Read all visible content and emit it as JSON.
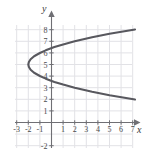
{
  "figure": {
    "background_color": "#ffffff",
    "grid_color": "#e2e2e6",
    "axis_color": "#6f6f74",
    "curve_color": "#58585e",
    "label_color": "#4a4a4a"
  },
  "axes": {
    "x_label": "x",
    "y_label": "y",
    "x_ticks": [
      "-3",
      "-2",
      "-1",
      "1",
      "2",
      "3",
      "4",
      "5",
      "6",
      "7"
    ],
    "y_ticks": [
      "8",
      "7",
      "6",
      "5",
      "4",
      "3",
      "2",
      "1",
      "-2"
    ]
  },
  "chart_data": {
    "type": "line",
    "title": "",
    "xlabel": "x",
    "ylabel": "y",
    "xlim": [
      -4,
      8
    ],
    "ylim": [
      -3,
      9
    ],
    "grid": true,
    "legend": null,
    "curve_description": "Rightward-opening parabola, vertex at (-2, 5)",
    "equation": "x = (y - 5)^2 - 2",
    "vertex": [
      -2,
      5
    ],
    "series": [
      {
        "name": "parabola",
        "points": [
          [
            7.2,
            8.02
          ],
          [
            5.0,
            7.65
          ],
          [
            3.5,
            7.35
          ],
          [
            2.0,
            7.0
          ],
          [
            1.0,
            6.73
          ],
          [
            0.25,
            6.5
          ],
          [
            -0.5,
            6.22
          ],
          [
            -1.0,
            5.99
          ],
          [
            -1.5,
            5.71
          ],
          [
            -1.8,
            5.45
          ],
          [
            -1.95,
            5.22
          ],
          [
            -2.0,
            5.0
          ],
          [
            -1.95,
            4.78
          ],
          [
            -1.8,
            4.55
          ],
          [
            -1.5,
            4.29
          ],
          [
            -1.0,
            4.01
          ],
          [
            -0.5,
            3.78
          ],
          [
            0.25,
            3.5
          ],
          [
            1.0,
            3.27
          ],
          [
            2.0,
            3.0
          ],
          [
            3.5,
            2.65
          ],
          [
            5.0,
            2.35
          ],
          [
            7.2,
            1.98
          ]
        ]
      }
    ],
    "x_tick_values": [
      -3,
      -2,
      -1,
      1,
      2,
      3,
      4,
      5,
      6,
      7
    ],
    "y_tick_values": [
      8,
      7,
      6,
      5,
      4,
      3,
      2,
      1,
      -2
    ]
  }
}
